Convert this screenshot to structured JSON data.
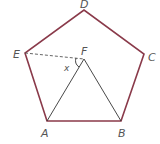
{
  "diagram": {
    "colors": {
      "pentagon": "#8a3a4a",
      "triangle": "#333333",
      "dashed": "#555555",
      "label": "#555555"
    },
    "points": {
      "A": {
        "label": "A",
        "x": 47,
        "y": 121
      },
      "B": {
        "label": "B",
        "x": 121,
        "y": 121
      },
      "C": {
        "label": "C",
        "x": 144,
        "y": 54
      },
      "D": {
        "label": "D",
        "x": 84,
        "y": 10
      },
      "E": {
        "label": "E",
        "x": 25,
        "y": 53
      },
      "F": {
        "label": "F",
        "x": 84,
        "y": 59
      }
    },
    "angle_label": "x"
  }
}
